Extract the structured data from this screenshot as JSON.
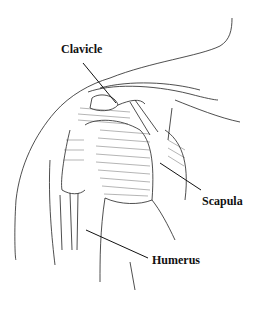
{
  "diagram": {
    "labels": [
      {
        "id": "clavicle",
        "text": "Clavicle"
      },
      {
        "id": "scapula",
        "text": "Scapula"
      },
      {
        "id": "humerus",
        "text": "Humerus"
      }
    ]
  }
}
